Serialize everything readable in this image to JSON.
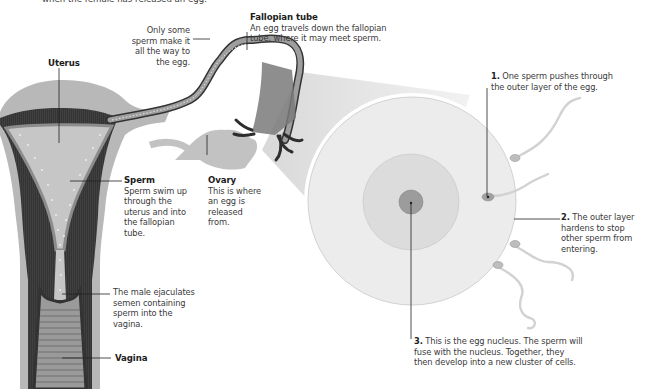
{
  "figure": {
    "top_caption_fragment": "when the female has released an egg.",
    "colors": {
      "uterus_outer": "#b9b9b9",
      "uterus_dark": "#333333",
      "uterus_mid": "#8a8a8a",
      "cavity": "#c4c4c4",
      "egg_outer": "#ececec",
      "egg_inner": "#dadada",
      "nucleus": "#9a9a9a",
      "zoom_beam": "#e2e2e2",
      "label_line": "#222222"
    }
  },
  "labels": {
    "uterus": {
      "title": "Uterus"
    },
    "fallopian_tube": {
      "title": "Fallopian tube",
      "text": "An egg travels down the fallopian tube, where it may meet sperm."
    },
    "only_some_sperm": {
      "text": "Only some sperm make it all the way to the egg."
    },
    "sperm": {
      "title": "Sperm",
      "text": "Sperm swim up through the uterus and into the fallopian tube."
    },
    "ovary": {
      "title": "Ovary",
      "text": "This is where an egg is released from."
    },
    "ejaculation": {
      "text": "The male ejaculates semen containing sperm into the vagina."
    },
    "vagina": {
      "title": "Vagina"
    },
    "step1": {
      "num": "1.",
      "text": "One sperm pushes through the outer layer of the egg."
    },
    "step2": {
      "num": "2.",
      "text": "The outer layer hardens to stop other sperm from entering."
    },
    "step3": {
      "num": "3.",
      "text": "This is the egg nucleus. The sperm will fuse with the nucleus. Together, they then develop into a new cluster of cells."
    }
  }
}
